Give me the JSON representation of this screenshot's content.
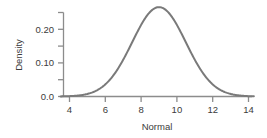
{
  "chart_data": {
    "type": "line",
    "title": "",
    "subtitle": "",
    "xlabel": "Normal",
    "ylabel": "Density",
    "xlim": [
      3.5,
      14.3
    ],
    "ylim": [
      0.0,
      0.275
    ],
    "grid": false,
    "legend": null,
    "x_ticks": [
      4,
      6,
      8,
      10,
      12,
      14
    ],
    "x_tick_labels": [
      "4",
      "6",
      "8",
      "10",
      "12",
      "14"
    ],
    "y_ticks": [
      0.0,
      0.05,
      0.1,
      0.15,
      0.2,
      0.25
    ],
    "y_tick_labels": [
      "0.0",
      "",
      "0.10",
      "",
      "0.20",
      ""
    ],
    "distribution": {
      "name": "normal",
      "mean": 9,
      "sd": 1.5,
      "peak_density": 0.266
    },
    "series": [
      {
        "name": "Normal density",
        "color": "#7a7a7a",
        "line_width": 2,
        "x": [
          3.5,
          4.0,
          4.5,
          5.0,
          5.5,
          6.0,
          6.5,
          7.0,
          7.5,
          8.0,
          8.5,
          9.0,
          9.5,
          10.0,
          10.5,
          11.0,
          11.5,
          12.0,
          12.5,
          13.0,
          13.5,
          14.0,
          14.3
        ],
        "values": [
          0.0005,
          0.0015,
          0.0038,
          0.0089,
          0.0186,
          0.0355,
          0.0614,
          0.0964,
          0.1374,
          0.1784,
          0.2104,
          0.266,
          0.2104,
          0.1784,
          0.1374,
          0.0964,
          0.0614,
          0.0355,
          0.0186,
          0.0089,
          0.0038,
          0.0015,
          0.0008
        ]
      }
    ],
    "colors": {
      "curve": "#7a7a7a",
      "axis": "#8c8c8c",
      "text": "#3b3b3b",
      "background": "#ffffff"
    }
  }
}
